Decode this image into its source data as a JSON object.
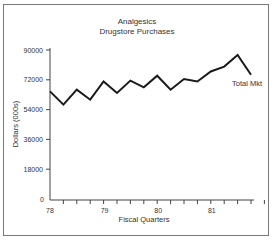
{
  "chart_data": {
    "type": "line",
    "title": "Analgesics",
    "subtitle": "Drugstore Purchases",
    "xlabel": "Fiscal Quarters",
    "ylabel": "Dollars (000s)",
    "ylim": [
      0,
      90000
    ],
    "yticks": [
      "90000",
      "72000",
      "54000",
      "36000",
      "18000",
      "0"
    ],
    "xtick_labels": [
      "78",
      "79",
      "80",
      "81"
    ],
    "grid": false,
    "legend_position": "inline label at line end",
    "series": [
      {
        "name": "Total Mkt",
        "x": [
          "78Q1",
          "78Q2",
          "78Q3",
          "78Q4",
          "79Q1",
          "79Q2",
          "79Q3",
          "79Q4",
          "80Q1",
          "80Q2",
          "80Q3",
          "80Q4",
          "81Q1",
          "81Q2",
          "81Q3",
          "81Q4"
        ],
        "values": [
          65000,
          57000,
          66000,
          60000,
          71000,
          64000,
          71500,
          67500,
          74500,
          66000,
          72500,
          71000,
          77000,
          80000,
          87000,
          75000
        ]
      }
    ]
  }
}
